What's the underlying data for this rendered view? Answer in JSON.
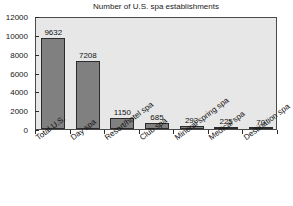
{
  "chart_data": {
    "type": "bar",
    "title": "Number of U.S. spa establishments",
    "xlabel": "",
    "ylabel": "",
    "categories": [
      "Total U.S.",
      "Day spa",
      "Resort/hotel spa",
      "Club spa",
      "Mineral spring spa",
      "Medical spa",
      "Destination spa"
    ],
    "values": [
      9632,
      7208,
      1150,
      685,
      293,
      225,
      70
    ],
    "value_labels": [
      "9632",
      "7208",
      "1150",
      "685",
      "293",
      "225",
      "70"
    ],
    "ylim": [
      0,
      12000
    ],
    "ytick_labels": [
      "0",
      "2000",
      "4000",
      "6000",
      "8000",
      "10000",
      "12000"
    ],
    "ytick_values": [
      0,
      2000,
      4000,
      6000,
      8000,
      10000,
      12000
    ],
    "grid": false,
    "legend": null,
    "legend_position": "none",
    "colors": {
      "bar_fill": "#808080",
      "bar_edge": "#2b2b2b",
      "plot_background": "#e7e7e7",
      "figure_background": "#ffffff",
      "text": "#141414",
      "axis": "#4a4a4a"
    }
  }
}
